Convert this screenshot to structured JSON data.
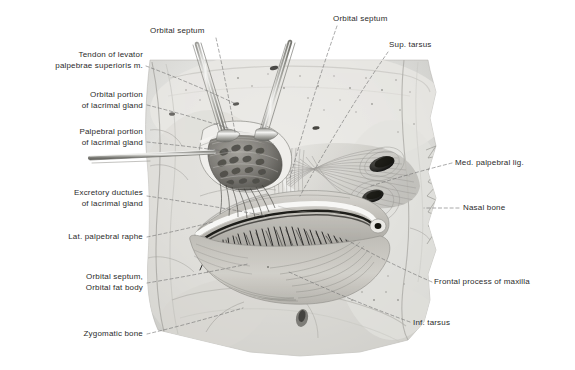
{
  "plate": {
    "title": "Orbital dissection: lacrimal gland, orbital septum and palpebral structures",
    "domain": "anatomical-illustration",
    "background_color": "#ffffff",
    "ink_color": "#2b2b2b",
    "leader_color": "#6e6e6e",
    "width": 575,
    "height": 370
  },
  "labels": [
    {
      "id": "tendon-levator",
      "text": "Tendon of levator\npalpebrae superioris m.",
      "align": "right",
      "x": 18,
      "y": 50,
      "w": 125,
      "anchor_x": 146,
      "anchor_y": 66,
      "target_x": 236,
      "target_y": 104
    },
    {
      "id": "orbital-portion-lacrimal",
      "text": "Orbital portion\nof lacrimal gland",
      "align": "right",
      "x": 23,
      "y": 90,
      "w": 120,
      "anchor_x": 147,
      "anchor_y": 105,
      "target_x": 228,
      "target_y": 128
    },
    {
      "id": "palpebral-portion-lacrimal",
      "text": "Palpebral portion\nof lacrimal gland",
      "align": "right",
      "x": 23,
      "y": 127,
      "w": 120,
      "anchor_x": 147,
      "anchor_y": 142,
      "target_x": 232,
      "target_y": 152
    },
    {
      "id": "excretory-ductules",
      "text": "Excretory ductules\nof lacrimal gland",
      "align": "right",
      "x": 23,
      "y": 188,
      "w": 120,
      "anchor_x": 147,
      "anchor_y": 196,
      "target_x": 266,
      "target_y": 216
    },
    {
      "id": "lat-palpebral-raphe",
      "text": "Lat. palpebral raphe",
      "align": "right",
      "x": 23,
      "y": 232,
      "w": 120,
      "anchor_x": 147,
      "anchor_y": 237,
      "target_x": 213,
      "target_y": 222
    },
    {
      "id": "orbital-septum-fat-body",
      "text": "Orbital septum,\nOrbital fat body",
      "align": "right",
      "x": 23,
      "y": 272,
      "w": 120,
      "anchor_x": 147,
      "anchor_y": 283,
      "target_x": 248,
      "target_y": 264
    },
    {
      "id": "zygomatic-bone",
      "text": "Zygomatic bone",
      "align": "right",
      "x": 23,
      "y": 329,
      "w": 120,
      "anchor_x": 147,
      "anchor_y": 334,
      "target_x": 243,
      "target_y": 308
    },
    {
      "id": "orbital-septum-left",
      "text": "Orbital septum",
      "align": "left",
      "x": 150,
      "y": 26,
      "w": 80,
      "anchor_x": 216,
      "anchor_y": 38,
      "target_x": 235,
      "target_y": 132
    },
    {
      "id": "orbital-septum-right",
      "text": "Orbital septum",
      "align": "left",
      "x": 333,
      "y": 14,
      "w": 80,
      "anchor_x": 337,
      "anchor_y": 26,
      "target_x": 290,
      "target_y": 178
    },
    {
      "id": "sup-tarsus",
      "text": "Sup. tarsus",
      "align": "left",
      "x": 389,
      "y": 40,
      "w": 64,
      "anchor_x": 388,
      "anchor_y": 52,
      "target_x": 300,
      "target_y": 196
    },
    {
      "id": "med-palpebral-lig",
      "text": "Med. palpebral lig.",
      "align": "left",
      "x": 455,
      "y": 158,
      "w": 105,
      "anchor_x": 452,
      "anchor_y": 163,
      "target_x": 371,
      "target_y": 186
    },
    {
      "id": "nasal-bone",
      "text": "Nasal bone",
      "align": "left",
      "x": 463,
      "y": 203,
      "w": 70,
      "anchor_x": 459,
      "anchor_y": 208,
      "target_x": 424,
      "target_y": 208
    },
    {
      "id": "frontal-process-maxilla",
      "text": "Frontal process of maxilla",
      "align": "left",
      "x": 434,
      "y": 277,
      "w": 140,
      "anchor_x": 432,
      "anchor_y": 282,
      "target_x": 345,
      "target_y": 239
    },
    {
      "id": "inf-tarsus",
      "text": "Inf. tarsus",
      "align": "left",
      "x": 413,
      "y": 318,
      "w": 62,
      "anchor_x": 410,
      "anchor_y": 322,
      "target_x": 289,
      "target_y": 272
    }
  ],
  "structures": [
    {
      "id": "specimen-mass",
      "name": "Dissected orbital specimen block"
    },
    {
      "id": "lacrimal-gland",
      "name": "Lacrimal gland exposed beneath retractors"
    },
    {
      "id": "orbital-septum",
      "name": "Orbital septum fibres"
    },
    {
      "id": "upper-eyelid",
      "name": "Upper eyelid margin with cilia"
    },
    {
      "id": "lower-eyelid",
      "name": "Lower eyelid / orbicularis oculi"
    },
    {
      "id": "medial-canthus",
      "name": "Medial canthal foramina"
    },
    {
      "id": "retractor-a",
      "name": "Surgical retractor (upper left)"
    },
    {
      "id": "retractor-b",
      "name": "Surgical retractor (upper right)"
    },
    {
      "id": "probe",
      "name": "Horizontal lacrimal probe"
    },
    {
      "id": "nasal-bone-edge",
      "name": "Serrated nasal bone margin"
    }
  ]
}
